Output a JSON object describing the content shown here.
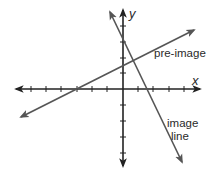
{
  "diagram": {
    "type": "coordinate-plane",
    "colors": {
      "axis": "#222222",
      "line": "#555555",
      "text": "#2a2a2a"
    },
    "axes": {
      "x_label": "x",
      "y_label": "y",
      "origin_px": [
        123,
        89
      ],
      "tick_spacing_px": 15.3,
      "x_ticks": [
        -6,
        -5,
        -4,
        -3,
        -2,
        -1,
        1,
        2,
        3,
        4,
        5
      ],
      "y_ticks": [
        4,
        3,
        2,
        1,
        -1,
        -2,
        -3,
        -4
      ]
    },
    "lines": [
      {
        "id": "pre-image",
        "label": "pre-image",
        "from": [
          21,
          117
        ],
        "to": [
          194,
          30
        ]
      },
      {
        "id": "image-line",
        "label_line1": "image",
        "label_line2": "line",
        "from": [
          110,
          12
        ],
        "to": [
          182,
          162
        ]
      }
    ]
  }
}
